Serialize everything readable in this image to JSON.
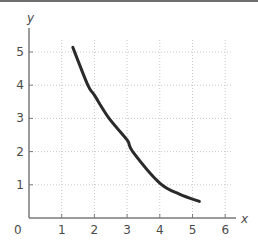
{
  "chart_data": {
    "type": "line",
    "title": "",
    "xlabel": "x",
    "ylabel": "y",
    "xlim": [
      0,
      6.3
    ],
    "ylim": [
      0,
      5.6
    ],
    "x_ticks": [
      0,
      1,
      2,
      3,
      4,
      5,
      6
    ],
    "y_ticks": [
      1,
      2,
      3,
      4,
      5
    ],
    "origin_label": "0",
    "grid": true,
    "grid_style": "dotted",
    "legend": null,
    "series": [
      {
        "name": "curve",
        "color": "#2a2a2a",
        "x": [
          1.34,
          1.8,
          2.0,
          2.45,
          3.0,
          3.17,
          4.0,
          4.6,
          5.21
        ],
        "y": [
          5.14,
          4.0,
          3.7,
          3.0,
          2.35,
          2.0,
          1.05,
          0.72,
          0.5
        ]
      }
    ]
  },
  "colors": {
    "axis": "#7a7a7a",
    "grid": "#c8c8c8",
    "curve": "#2a2a2a",
    "text": "#4a4a4a",
    "top_border": "#6e6e6e"
  }
}
